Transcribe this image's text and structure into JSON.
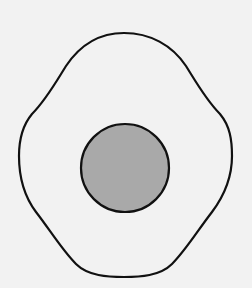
{
  "diagram": {
    "background": "#f2f2f2",
    "outer_shape": {
      "type": "wavy-closed-outline",
      "stroke": "#111111",
      "fill": "none",
      "stroke_width": 2.2
    },
    "inner_circle": {
      "type": "circle",
      "cx": 125,
      "cy": 168,
      "r": 44,
      "fill": "#a9a9a9",
      "stroke": "#111111",
      "stroke_width": 2.2
    }
  }
}
